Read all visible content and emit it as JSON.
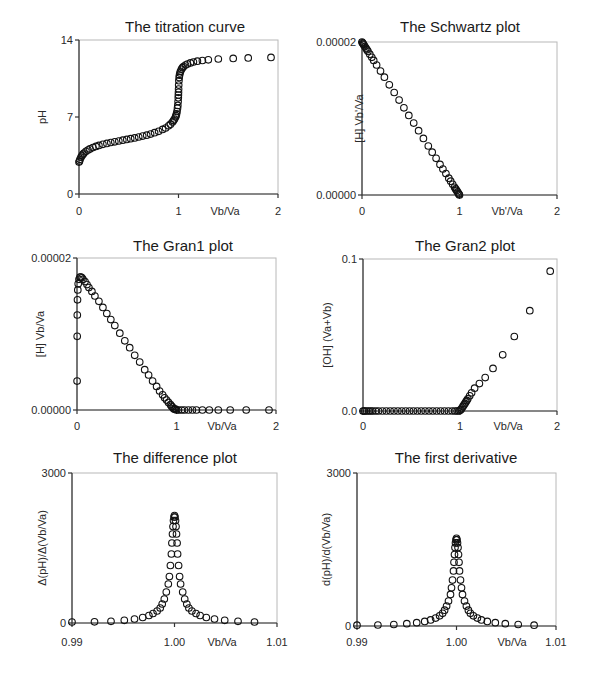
{
  "chart_data": [
    {
      "id": "titration",
      "type": "scatter",
      "title": "The titration curve",
      "xlabel": "Vb/Va",
      "ylabel": "pH",
      "xlim": [
        0,
        2
      ],
      "ylim": [
        0,
        14
      ],
      "xticks": [
        "0",
        "1",
        "2"
      ],
      "xtick_values": [
        0,
        1,
        2
      ],
      "yticks": [
        "0",
        "7",
        "14"
      ],
      "ytick_values": [
        0,
        7,
        14
      ],
      "x": [
        0.0,
        0.005,
        0.01,
        0.02,
        0.03,
        0.04,
        0.05,
        0.07,
        0.09,
        0.11,
        0.14,
        0.17,
        0.2,
        0.24,
        0.28,
        0.32,
        0.36,
        0.4,
        0.44,
        0.48,
        0.52,
        0.56,
        0.6,
        0.64,
        0.68,
        0.72,
        0.76,
        0.8,
        0.84,
        0.87,
        0.9,
        0.92,
        0.94,
        0.95,
        0.96,
        0.97,
        0.975,
        0.98,
        0.985,
        0.99,
        0.993,
        0.996,
        0.998,
        0.999,
        1.0,
        1.001,
        1.002,
        1.004,
        1.007,
        1.01,
        1.015,
        1.02,
        1.03,
        1.04,
        1.05,
        1.07,
        1.09,
        1.12,
        1.15,
        1.19,
        1.24,
        1.3,
        1.4,
        1.55,
        1.7,
        1.93
      ],
      "y": [
        2.9,
        3.0,
        3.15,
        3.35,
        3.5,
        3.62,
        3.72,
        3.88,
        4.0,
        4.1,
        4.22,
        4.33,
        4.42,
        4.52,
        4.6,
        4.68,
        4.75,
        4.82,
        4.89,
        4.96,
        5.03,
        5.1,
        5.18,
        5.26,
        5.35,
        5.45,
        5.57,
        5.7,
        5.87,
        6.0,
        6.2,
        6.35,
        6.55,
        6.67,
        6.82,
        7.0,
        7.12,
        7.28,
        7.5,
        7.8,
        8.05,
        8.4,
        8.75,
        9.0,
        9.25,
        9.55,
        9.9,
        10.3,
        10.6,
        10.8,
        11.0,
        11.15,
        11.35,
        11.48,
        11.58,
        11.72,
        11.82,
        11.92,
        12.0,
        12.07,
        12.14,
        12.2,
        12.27,
        12.33,
        12.37,
        12.42
      ]
    },
    {
      "id": "schwartz",
      "type": "scatter",
      "title": "The Schwartz plot",
      "xlabel": "Vb'/Va",
      "ylabel": "[H] Vb'/Va",
      "xlim": [
        0,
        2
      ],
      "ylim": [
        0,
        2e-05
      ],
      "xticks": [
        "0",
        "1",
        "2"
      ],
      "xtick_values": [
        0,
        1,
        2
      ],
      "yticks": [
        "0.00000",
        "0.00002"
      ],
      "ytick_values": [
        0,
        2e-05
      ],
      "x": [
        0.0,
        0.005,
        0.01,
        0.015,
        0.02,
        0.03,
        0.04,
        0.05,
        0.06,
        0.08,
        0.1,
        0.12,
        0.15,
        0.19,
        0.23,
        0.28,
        0.33,
        0.38,
        0.43,
        0.48,
        0.53,
        0.58,
        0.63,
        0.68,
        0.72,
        0.76,
        0.8,
        0.83,
        0.86,
        0.89,
        0.91,
        0.93,
        0.95,
        0.96,
        0.97,
        0.98,
        0.99,
        0.995,
        1.0
      ],
      "y": [
        2e-05,
        1.99e-05,
        1.98e-05,
        1.97e-05,
        1.96e-05,
        1.94e-05,
        1.92e-05,
        1.9e-05,
        1.88e-05,
        1.84e-05,
        1.8e-05,
        1.76e-05,
        1.7e-05,
        1.62e-05,
        1.54e-05,
        1.44e-05,
        1.34e-05,
        1.24e-05,
        1.14e-05,
        1.04e-05,
        9.4e-06,
        8.4e-06,
        7.4e-06,
        6.4e-06,
        5.6e-06,
        4.8e-06,
        4e-06,
        3.4e-06,
        2.8e-06,
        2.2e-06,
        1.8e-06,
        1.4e-06,
        1e-06,
        8e-07,
        6e-07,
        4e-07,
        2e-07,
        1e-07,
        0.0
      ]
    },
    {
      "id": "gran1",
      "type": "scatter",
      "title": "The Gran1 plot",
      "xlabel": "Vb/Va",
      "ylabel": "[H] Vb/Va",
      "xlim": [
        0,
        2
      ],
      "ylim": [
        0,
        2e-05
      ],
      "xticks": [
        "0",
        "1",
        "2"
      ],
      "xtick_values": [
        0,
        1,
        2
      ],
      "yticks": [
        "0.00000",
        "0.00002"
      ],
      "ytick_values": [
        0,
        2e-05
      ],
      "x": [
        0.001,
        0.002,
        0.003,
        0.005,
        0.008,
        0.012,
        0.02,
        0.03,
        0.04,
        0.05,
        0.06,
        0.08,
        0.1,
        0.12,
        0.15,
        0.18,
        0.22,
        0.26,
        0.3,
        0.34,
        0.38,
        0.43,
        0.48,
        0.53,
        0.58,
        0.63,
        0.68,
        0.72,
        0.76,
        0.8,
        0.83,
        0.86,
        0.88,
        0.9,
        0.92,
        0.94,
        0.95,
        0.96,
        0.97,
        0.98,
        0.99,
        1.0,
        1.02,
        1.05,
        1.08,
        1.12,
        1.16,
        1.2,
        1.26,
        1.33,
        1.42,
        1.54,
        1.7,
        1.93
      ],
      "y": [
        3.8e-06,
        9.7e-06,
        1.25e-05,
        1.45e-05,
        1.58e-05,
        1.66e-05,
        1.72e-05,
        1.75e-05,
        1.75e-05,
        1.74e-05,
        1.72e-05,
        1.69e-05,
        1.65e-05,
        1.61e-05,
        1.56e-05,
        1.5e-05,
        1.43e-05,
        1.35e-05,
        1.27e-05,
        1.19e-05,
        1.11e-05,
        1.01e-05,
        9.1e-06,
        8.2e-06,
        7.2e-06,
        6.3e-06,
        5.3e-06,
        4.6e-06,
        3.8e-06,
        3.1e-06,
        2.5e-06,
        2e-06,
        1.6e-06,
        1.3e-06,
        1e-06,
        7e-07,
        5e-07,
        4e-07,
        2e-07,
        1e-07,
        1e-07,
        0.0,
        0.0,
        0.0,
        0.0,
        0.0,
        0.0,
        0.0,
        0.0,
        0.0,
        0.0,
        0.0,
        0.0,
        0.0
      ]
    },
    {
      "id": "gran2",
      "type": "scatter",
      "title": "The Gran2 plot",
      "xlabel": "Vb/Va",
      "ylabel": "[OH] (Va+Vb)",
      "xlim": [
        0,
        2
      ],
      "ylim": [
        0,
        0.1
      ],
      "xticks": [
        "0",
        "1",
        "2"
      ],
      "xtick_values": [
        0,
        1,
        2
      ],
      "yticks": [
        "0.0",
        "0.1"
      ],
      "ytick_values": [
        0,
        0.1
      ],
      "x": [
        0.0,
        0.01,
        0.02,
        0.04,
        0.06,
        0.08,
        0.1,
        0.13,
        0.16,
        0.2,
        0.24,
        0.28,
        0.32,
        0.36,
        0.4,
        0.44,
        0.48,
        0.52,
        0.56,
        0.6,
        0.64,
        0.68,
        0.72,
        0.76,
        0.8,
        0.84,
        0.88,
        0.92,
        0.95,
        0.97,
        0.99,
        1.0,
        1.01,
        1.02,
        1.03,
        1.04,
        1.05,
        1.06,
        1.07,
        1.08,
        1.1,
        1.12,
        1.15,
        1.2,
        1.26,
        1.34,
        1.44,
        1.56,
        1.72,
        1.93
      ],
      "y": [
        0.0,
        0.0,
        0.0,
        0.0,
        0.0,
        0.0,
        0.0,
        0.0,
        0.0,
        0.0,
        0.0,
        0.0,
        0.0,
        0.0,
        0.0,
        0.0,
        0.0,
        0.0,
        0.0,
        0.0,
        0.0,
        0.0,
        0.0,
        0.0,
        0.0,
        0.0,
        0.0,
        0.0,
        0.0,
        0.0,
        0.0,
        0.0005,
        0.001,
        0.002,
        0.003,
        0.004,
        0.005,
        0.006,
        0.007,
        0.008,
        0.01,
        0.012,
        0.015,
        0.018,
        0.022,
        0.028,
        0.037,
        0.049,
        0.066,
        0.092
      ]
    },
    {
      "id": "difference",
      "type": "scatter",
      "title": "The difference plot",
      "xlabel": "Vb/Va",
      "ylabel": "Δ(pH)/Δ(Vb/Va)",
      "xlim": [
        0.99,
        1.01
      ],
      "ylim": [
        0,
        3000
      ],
      "xticks": [
        "0.99",
        "1.00",
        "1.01"
      ],
      "xtick_values": [
        0.99,
        1.0,
        1.01
      ],
      "yticks": [
        "0",
        "3000"
      ],
      "ytick_values": [
        0,
        3000
      ],
      "x": [
        0.99,
        0.9922,
        0.9938,
        0.9951,
        0.9961,
        0.9969,
        0.9975,
        0.9979,
        0.9983,
        0.9986,
        0.9988,
        0.999,
        0.9992,
        0.9994,
        0.9995,
        0.9996,
        0.9997,
        0.99975,
        0.9998,
        0.99985,
        0.9999,
        0.99995,
        1.0,
        1.00005,
        1.0001,
        1.00015,
        1.0002,
        1.00025,
        1.0003,
        1.0004,
        1.0005,
        1.0006,
        1.0008,
        1.001,
        1.0012,
        1.0014,
        1.0017,
        1.0021,
        1.0025,
        1.0031,
        1.0039,
        1.0049,
        1.0062,
        1.0078
      ],
      "y": [
        20,
        25,
        35,
        55,
        80,
        110,
        150,
        190,
        240,
        300,
        380,
        480,
        620,
        780,
        930,
        1150,
        1380,
        1600,
        1780,
        1930,
        2050,
        2120,
        2150,
        2120,
        2050,
        1930,
        1780,
        1600,
        1380,
        1150,
        930,
        780,
        620,
        480,
        380,
        300,
        240,
        190,
        150,
        110,
        80,
        55,
        35,
        20
      ]
    },
    {
      "id": "first-derivative",
      "type": "scatter",
      "title": "The first derivative",
      "xlabel": "Vb/Va",
      "ylabel": "d(pH)/d(Vb/Va)",
      "xlim": [
        0.99,
        1.01
      ],
      "ylim": [
        0,
        3000
      ],
      "xticks": [
        "0.99",
        "1.00",
        "1.01"
      ],
      "xtick_values": [
        0.99,
        1.0,
        1.01
      ],
      "yticks": [
        "0",
        "3000"
      ],
      "ytick_values": [
        0,
        3000
      ],
      "x": [
        0.99,
        0.9921,
        0.9937,
        0.995,
        0.996,
        0.9968,
        0.9974,
        0.9979,
        0.9983,
        0.9986,
        0.9988,
        0.999,
        0.9992,
        0.9994,
        0.9995,
        0.9996,
        0.9997,
        0.99975,
        0.9998,
        0.99985,
        0.9999,
        0.99995,
        1.0,
        1.00005,
        1.0001,
        1.00015,
        1.0002,
        1.00025,
        1.0003,
        1.0004,
        1.0005,
        1.0006,
        1.0008,
        1.001,
        1.0012,
        1.0014,
        1.0017,
        1.0021,
        1.0025,
        1.0031,
        1.0039,
        1.0049,
        1.0062,
        1.0078
      ],
      "y": [
        15,
        20,
        30,
        45,
        65,
        90,
        120,
        155,
        200,
        250,
        310,
        390,
        490,
        620,
        750,
        900,
        1080,
        1250,
        1400,
        1540,
        1630,
        1690,
        1720,
        1690,
        1630,
        1540,
        1400,
        1250,
        1080,
        900,
        750,
        620,
        490,
        390,
        310,
        250,
        200,
        155,
        120,
        90,
        65,
        45,
        30,
        15
      ]
    }
  ]
}
